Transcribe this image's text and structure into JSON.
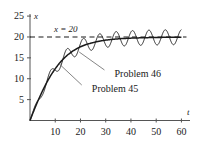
{
  "chart_data": {
    "type": "line",
    "title": "",
    "subtitle": "",
    "xlabel": "t",
    "ylabel": "x",
    "xlim": [
      0,
      63
    ],
    "ylim": [
      0,
      25.5
    ],
    "grid": false,
    "legend_position": "inline-annotations",
    "xticks": [
      10,
      20,
      30,
      40,
      50,
      60
    ],
    "yticks": [
      5,
      10,
      15,
      20,
      25
    ],
    "xtick_labels": [
      "10",
      "20",
      "30",
      "40",
      "50",
      "60"
    ],
    "ytick_labels": [
      "5",
      "10",
      "15",
      "20",
      "25"
    ],
    "annotations": [
      {
        "name": "equilibrium-line-label",
        "text": "x = 20",
        "x": 9.5,
        "y": 21.6,
        "style": "italic"
      }
    ],
    "reference_lines": [
      {
        "name": "equilibrium-line",
        "orientation": "horizontal",
        "value": 20,
        "style": "dashed",
        "color": "#1a1a1a",
        "x_start": 0,
        "x_end": 62
      }
    ],
    "series": [
      {
        "name": "Problem 45",
        "label": "Problem 45",
        "color": "#1a1a1a",
        "style": "solid",
        "width": 1.5,
        "description": "smooth monotone logistic curve rising from 0 to the equilibrium x = 20",
        "label_x": 24.5,
        "label_y": 7.2,
        "leader_from_x": 20.5,
        "leader_from_y": 8.5,
        "leader_to_x": 11.5,
        "leader_to_y": 13.6,
        "points": [
          {
            "t": 0,
            "x": 0
          },
          {
            "t": 1,
            "x": 1.55
          },
          {
            "t": 2,
            "x": 3.05
          },
          {
            "t": 3,
            "x": 4.5
          },
          {
            "t": 4,
            "x": 5.85
          },
          {
            "t": 5,
            "x": 7.15
          },
          {
            "t": 6,
            "x": 8.35
          },
          {
            "t": 7,
            "x": 9.5
          },
          {
            "t": 8,
            "x": 10.55
          },
          {
            "t": 9,
            "x": 11.5
          },
          {
            "t": 10,
            "x": 12.4
          },
          {
            "t": 11,
            "x": 13.2
          },
          {
            "t": 12,
            "x": 13.95
          },
          {
            "t": 13,
            "x": 14.6
          },
          {
            "t": 14,
            "x": 15.2
          },
          {
            "t": 15,
            "x": 15.75
          },
          {
            "t": 16,
            "x": 16.2
          },
          {
            "t": 17,
            "x": 16.65
          },
          {
            "t": 18,
            "x": 17.0
          },
          {
            "t": 19,
            "x": 17.35
          },
          {
            "t": 20,
            "x": 17.65
          },
          {
            "t": 22,
            "x": 18.15
          },
          {
            "t": 24,
            "x": 18.5
          },
          {
            "t": 26,
            "x": 18.8
          },
          {
            "t": 28,
            "x": 19.05
          },
          {
            "t": 30,
            "x": 19.25
          },
          {
            "t": 33,
            "x": 19.45
          },
          {
            "t": 36,
            "x": 19.6
          },
          {
            "t": 40,
            "x": 19.72
          },
          {
            "t": 45,
            "x": 19.82
          },
          {
            "t": 50,
            "x": 19.88
          },
          {
            "t": 55,
            "x": 19.93
          },
          {
            "t": 60,
            "x": 19.96
          }
        ]
      },
      {
        "name": "Problem 46",
        "label": "Problem 46",
        "color": "#1a1a1a",
        "style": "solid",
        "width": 0.9,
        "description": "oscillating solution about the Problem 45 curve; period about 6.5 t-units, amplitude growing from near 0 to about 1.8 and then holding steady",
        "label_x": 33.5,
        "label_y": 11.0,
        "leader_from_x": 29.5,
        "leader_from_y": 12.1,
        "leader_to_x": 19.5,
        "leader_to_y": 16.4,
        "oscillation": {
          "period": 6.5,
          "phase": 0,
          "amplitude_profile": [
            {
              "t": 0,
              "amp": 0.1
            },
            {
              "t": 3,
              "amp": 0.7
            },
            {
              "t": 6,
              "amp": 1.1
            },
            {
              "t": 10,
              "amp": 1.45
            },
            {
              "t": 16,
              "amp": 1.65
            },
            {
              "t": 24,
              "amp": 1.75
            },
            {
              "t": 40,
              "amp": 1.8
            },
            {
              "t": 60,
              "amp": 1.8
            }
          ]
        }
      }
    ]
  },
  "axes": {
    "y_axis_name": "x",
    "x_axis_name": "t"
  }
}
